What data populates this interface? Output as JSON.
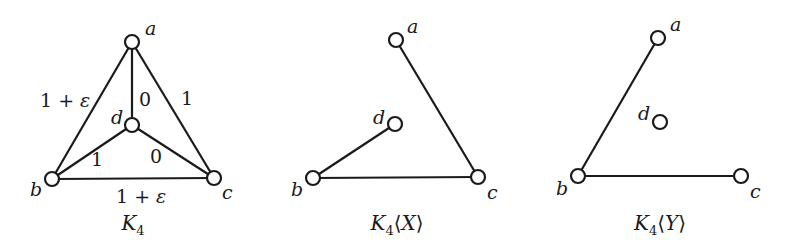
{
  "figure": {
    "graphs": [
      {
        "id": "K4",
        "caption": {
          "main": "K",
          "subscript": "4",
          "suffix": ""
        },
        "vertices": [
          {
            "id": "a",
            "label": "a"
          },
          {
            "id": "b",
            "label": "b"
          },
          {
            "id": "c",
            "label": "c"
          },
          {
            "id": "d",
            "label": "d"
          }
        ],
        "edges": [
          {
            "from": "a",
            "to": "b",
            "weight": "1 + ε"
          },
          {
            "from": "a",
            "to": "c",
            "weight": "1"
          },
          {
            "from": "a",
            "to": "d",
            "weight": "0"
          },
          {
            "from": "b",
            "to": "c",
            "weight": "1 + ε"
          },
          {
            "from": "b",
            "to": "d",
            "weight": "1"
          },
          {
            "from": "d",
            "to": "c",
            "weight": "0"
          }
        ]
      },
      {
        "id": "K4X",
        "caption": {
          "main": "K",
          "subscript": "4",
          "suffix": "⟨X⟩"
        },
        "vertices": [
          {
            "id": "a",
            "label": "a"
          },
          {
            "id": "b",
            "label": "b"
          },
          {
            "id": "c",
            "label": "c"
          },
          {
            "id": "d",
            "label": "d"
          }
        ],
        "edges": [
          {
            "from": "a",
            "to": "c",
            "weight": ""
          },
          {
            "from": "b",
            "to": "c",
            "weight": ""
          },
          {
            "from": "b",
            "to": "d",
            "weight": ""
          }
        ]
      },
      {
        "id": "K4Y",
        "caption": {
          "main": "K",
          "subscript": "4",
          "suffix": "⟨Y⟩"
        },
        "vertices": [
          {
            "id": "a",
            "label": "a"
          },
          {
            "id": "b",
            "label": "b"
          },
          {
            "id": "c",
            "label": "c"
          },
          {
            "id": "d",
            "label": "d"
          }
        ],
        "edges": [
          {
            "from": "a",
            "to": "b",
            "weight": ""
          },
          {
            "from": "b",
            "to": "c",
            "weight": ""
          }
        ]
      }
    ]
  }
}
